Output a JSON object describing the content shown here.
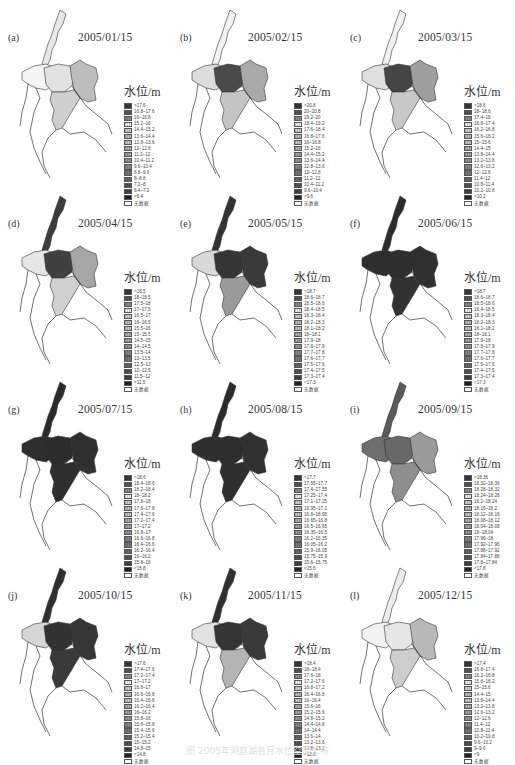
{
  "figure": {
    "legend_title": "水位/m",
    "no_data_label": "无数据",
    "caption": "图  2005年洞庭湖各月水位空间分布"
  },
  "panels": [
    {
      "label": "(a)",
      "date": "2005/01/15",
      "fill": {
        "west": "#f4f4f4",
        "north": "#e8e8e8",
        "core": "#e2e2e2",
        "east": "#bdbdbd",
        "south": "#cfcfcf"
      },
      "legend": [
        ">17.6",
        "16.8–17.6",
        "16–16.8",
        "15.2–16",
        "14.4–15.2",
        "13.6–14.4",
        "12.8–13.6",
        "12–12.8",
        "11.2–12",
        "10.4–11.2",
        "9.6–10.4",
        "8.8–9.6",
        "8–8.8",
        "7.2–8",
        "6.4–7.2",
        "<6.4"
      ]
    },
    {
      "label": "(b)",
      "date": "2005/02/15",
      "fill": {
        "west": "#dcdcdc",
        "north": "#f2f2f2",
        "core": "#4a4a4a",
        "east": "#a9a9a9",
        "south": "#c4c4c4"
      },
      "legend": [
        ">20.8",
        "20–20.8",
        "19.2–20",
        "18.4–19.2",
        "17.6–18.4",
        "16.8–17.6",
        "16–16.8",
        "15.2–16",
        "14.4–15.2",
        "13.6–14.4",
        "12.8–13.6",
        "12–12.8",
        "11.2–12",
        "10.4–11.2",
        "9.6–10.4",
        "<9.6"
      ]
    },
    {
      "label": "(c)",
      "date": "2005/03/15",
      "fill": {
        "west": "#e0e0e0",
        "north": "#f2f2f2",
        "core": "#454545",
        "east": "#9e9e9e",
        "south": "#c8c8c8"
      },
      "legend": [
        ">18.6",
        "18–18.6",
        "17.4–18",
        "16.8–17.4",
        "16.2–16.8",
        "15.6–16.2",
        "15–15.6",
        "14.4–15",
        "13.8–14.4",
        "13.2–13.8",
        "12.6–13.2",
        "12–12.6",
        "11.4–12",
        "10.8–11.4",
        "10.2–10.8",
        "<10.2"
      ]
    },
    {
      "label": "(d)",
      "date": "2005/04/15",
      "fill": {
        "west": "#e6e6e6",
        "north": "#3c3c3c",
        "core": "#404040",
        "east": "#a6a6a6",
        "south": "#d0d0d0"
      },
      "legend": [
        ">18.5",
        "18–18.5",
        "17.5–18",
        "17–17.5",
        "16.5–17",
        "16–16.5",
        "15.5–16",
        "15–15.5",
        "14.5–15",
        "14–14.5",
        "13.5–14",
        "13–13.5",
        "12.5–13",
        "12–12.5",
        "11.5–12",
        "<11.5"
      ]
    },
    {
      "label": "(e)",
      "date": "2005/05/15",
      "fill": {
        "west": "#d8d8d8",
        "north": "#333333",
        "core": "#353535",
        "east": "#3a3a3a",
        "south": "#9a9a9a"
      },
      "legend": [
        ">18.7",
        "18.6–18.7",
        "18.5–18.6",
        "18.4–18.5",
        "18.3–18.4",
        "18.2–18.3",
        "18.1–18.2",
        "18–18.1",
        "17.9–18",
        "17.8–17.9",
        "17.7–17.8",
        "17.6–17.7",
        "17.5–17.6",
        "17.4–17.5",
        "17.3–17.4",
        "<17.3"
      ]
    },
    {
      "label": "(f)",
      "date": "2005/06/15",
      "fill": {
        "west": "#2e2e2e",
        "north": "#2c2c2c",
        "core": "#2f2f2f",
        "east": "#303030",
        "south": "#333333"
      },
      "legend": [
        ">18.7",
        "18.6–18.7",
        "18.5–18.6",
        "18.4–18.5",
        "18.3–18.4",
        "18.2–18.3",
        "18.1–18.2",
        "18–18.1",
        "17.9–18",
        "17.8–17.9",
        "17.7–17.8",
        "17.6–17.7",
        "17.5–17.6",
        "17.4–17.5",
        "17.3–17.4",
        "<17.3"
      ]
    },
    {
      "label": "(g)",
      "date": "2005/07/15",
      "fill": {
        "west": "#2e2e2e",
        "north": "#2a2a2a",
        "core": "#2c2c2c",
        "east": "#303030",
        "south": "#2e2e2e"
      },
      "legend": [
        ">18.6",
        "18.4–18.6",
        "18.2–18.4",
        "18–18.2",
        "17.8–18",
        "17.6–17.8",
        "17.4–17.6",
        "17.2–17.4",
        "17–17.2",
        "16.8–17",
        "16.6–16.8",
        "16.4–16.6",
        "16.2–16.4",
        "16–16.2",
        "15.8–16",
        "<15.8"
      ]
    },
    {
      "label": "(h)",
      "date": "2005/08/15",
      "fill": {
        "west": "#2f2f2f",
        "north": "#2b2b2b",
        "core": "#2d2d2d",
        "east": "#313131",
        "south": "#2f2f2f"
      },
      "legend": [
        ">17.7",
        "17.55–17.7",
        "17.4–17.55",
        "17.25–17.4",
        "17.1–17.25",
        "16.95–17.1",
        "16.8–16.95",
        "16.65–16.8",
        "16.5–16.65",
        "16.35–16.5",
        "16.2–16.35",
        "16.05–16.2",
        "15.9–16.05",
        "15.75–15.9",
        "15.6–15.75",
        "<15.6"
      ]
    },
    {
      "label": "(i)",
      "date": "2005/09/15",
      "fill": {
        "west": "#6e6e6e",
        "north": "#5a5a5a",
        "core": "#686868",
        "east": "#9a9a9a",
        "south": "#8e8e8e"
      },
      "legend": [
        ">18.36",
        "18.32–18.36",
        "18.28–18.32",
        "18.24–18.28",
        "18.2–18.24",
        "18.16–18.2",
        "18.12–18.16",
        "18.08–18.12",
        "18.04–18.08",
        "18–18.04",
        "17.96–18",
        "17.92–17.96",
        "17.88–17.92",
        "17.84–17.88",
        "17.8–17.84",
        "<17.8"
      ]
    },
    {
      "label": "(j)",
      "date": "2005/10/15",
      "fill": {
        "west": "#d6d6d6",
        "north": "#2f2f2f",
        "core": "#323232",
        "east": "#363636",
        "south": "#3a3a3a"
      },
      "legend": [
        ">17.6",
        "17.4–17.6",
        "17.2–17.4",
        "17–17.2",
        "16.8–17",
        "16.6–16.8",
        "16.4–16.6",
        "16.2–16.4",
        "16–16.2",
        "15.8–16",
        "15.6–15.8",
        "15.4–15.6",
        "15.2–15.4",
        "15–15.2",
        "14.8–15",
        "<14.8"
      ]
    },
    {
      "label": "(k)",
      "date": "2005/11/15",
      "fill": {
        "west": "#e2e2e2",
        "north": "#303030",
        "core": "#353535",
        "east": "#3a3a3a",
        "south": "#b4b4b4"
      },
      "legend": [
        ">18.4",
        "18–18.4",
        "17.6–18",
        "17.2–17.6",
        "16.8–17.2",
        "16.4–16.8",
        "16–16.4",
        "15.6–16",
        "15.2–15.6",
        "14.8–15.2",
        "14.4–14.8",
        "14–14.4",
        "13.6–14",
        "13.2–13.6",
        "12.8–13.2",
        "<12.8"
      ]
    },
    {
      "label": "(l)",
      "date": "2005/12/15",
      "fill": {
        "west": "#f2f2f2",
        "north": "#ededed",
        "core": "#e6e6e6",
        "east": "#b8b8b8",
        "south": "#cdcdcd"
      },
      "legend": [
        ">17.4",
        "16.8–17.4",
        "16.2–16.8",
        "15.6–16.2",
        "15–15.6",
        "14.4–15",
        "13.8–14.4",
        "13.2–13.8",
        "12.6–13.2",
        "12–12.6",
        "11.4–12",
        "10.8–11.4",
        "10.2–10.8",
        "9.6–10.2",
        "9–9.6",
        "<9"
      ]
    }
  ],
  "legend_colors": [
    "#3a3a3a",
    "#5a5a5a",
    "#8e8e8e",
    "#f4f4f4",
    "#d2d2d2",
    "#bdbdbd",
    "#c8c8c8",
    "#b0b0b0",
    "#a4a4a4",
    "#989898",
    "#8a8a8a",
    "#7a7a7a",
    "#6a6a6a",
    "#565656",
    "#444444",
    "#262626"
  ]
}
